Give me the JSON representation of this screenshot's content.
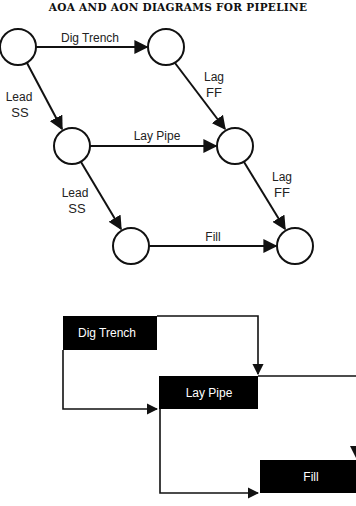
{
  "title": "AOA AND AON DIAGRAMS FOR PIPELINE",
  "aoa": {
    "nodes": [
      {
        "id": "n1",
        "cx": 18,
        "cy": 47
      },
      {
        "id": "n2",
        "cx": 166,
        "cy": 47
      },
      {
        "id": "n3",
        "cx": 72,
        "cy": 146
      },
      {
        "id": "n4",
        "cx": 235,
        "cy": 146
      },
      {
        "id": "n5",
        "cx": 131,
        "cy": 246
      },
      {
        "id": "n6",
        "cx": 295,
        "cy": 246
      }
    ],
    "activities": {
      "dig_trench": "Dig Trench",
      "lay_pipe": "Lay Pipe",
      "fill": "Fill"
    },
    "relations": {
      "lead1_line1": "Lead",
      "lead1_line2": "SS",
      "lag1_line1": "Lag",
      "lag1_line2": "FF",
      "lead2_line1": "Lead",
      "lead2_line2": "SS",
      "lag2_line1": "Lag",
      "lag2_line2": "FF"
    }
  },
  "aon": {
    "boxes": {
      "dig_trench": "Dig Trench",
      "lay_pipe": "Lay Pipe",
      "fill": "Fill"
    }
  },
  "colors": {
    "line": "#111111",
    "box_fill": "#000000",
    "box_text": "#ffffff"
  }
}
